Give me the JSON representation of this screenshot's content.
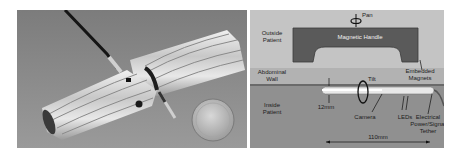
{
  "figure": {
    "left_panel": {
      "description": "Photo of magnetically anchored cylindrical robotic camera device next to a coin",
      "colors": {
        "background": "#8a8a8a",
        "device_body": "#d8d8d8",
        "tether": "#1a1a1a",
        "coin": "#bdbdbd"
      }
    },
    "right_panel": {
      "labels": {
        "pan": "Pan",
        "outside_patient": "Outside\nPatient",
        "magnetic_handle": "Magnetic Handle",
        "abdominal_wall": "Abdominal\nWall",
        "embedded_magnets": "Embedded\nMagnets",
        "tilt": "Tilt",
        "inside_patient": "Inside\nPatient",
        "diameter": "12mm",
        "camera": "Camera",
        "leds": "LEDs",
        "tether": "Electrical\nPower/Signal\nTether",
        "length": "110mm"
      },
      "colors": {
        "outside_bg": "#c4c4c4",
        "handle": "#5a5a5a",
        "wall": "#b0b0b0",
        "inside_bg": "#8e8e8e",
        "device": "#e6e6e6"
      }
    }
  }
}
